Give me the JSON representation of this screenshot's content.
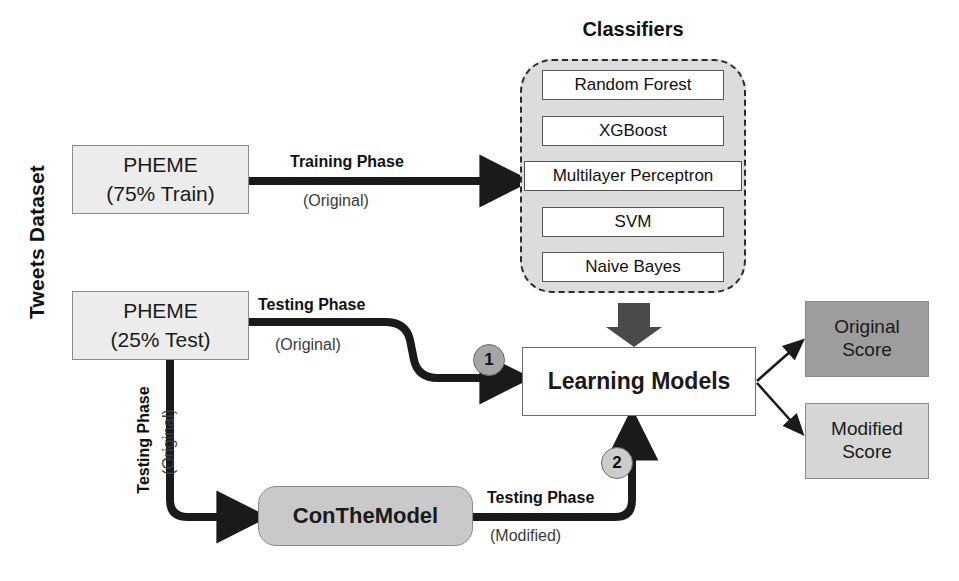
{
  "diagram": {
    "dataset_label": "Tweets Dataset",
    "classifiers": {
      "title": "Classifiers",
      "items": [
        {
          "label": "Random Forest"
        },
        {
          "label": "XGBoost"
        },
        {
          "label": "Multilayer Perceptron"
        },
        {
          "label": "SVM"
        },
        {
          "label": "Naive Bayes"
        }
      ]
    },
    "nodes": {
      "pheme_train": {
        "line1": "PHEME",
        "line2": "(75% Train)"
      },
      "pheme_test": {
        "line1": "PHEME",
        "line2": "(25% Test)"
      },
      "learning_models": {
        "label": "Learning Models"
      },
      "conthemodel": {
        "label": "ConTheModel"
      },
      "original_score": {
        "line1": "Original",
        "line2": "Score"
      },
      "modified_score": {
        "line1": "Modified",
        "line2": "Score"
      }
    },
    "edge_labels": {
      "training_phase": "Training Phase",
      "training_original": "(Original)",
      "testing_phase_top": "Testing Phase",
      "testing_original_top": "(Original)",
      "testing_phase_down": "Testing Phase",
      "testing_original_down": "(Original)",
      "testing_phase_bottom": "Testing Phase",
      "testing_modified_bottom": "(Modified)"
    },
    "steps": {
      "step1": "1",
      "step2": "2"
    },
    "colors": {
      "pheme_fill": "#ececec",
      "classifier_group_fill": "#dcdcdc",
      "classifier_item_fill": "#ffffff",
      "conthemodel_fill": "#c9c9c9",
      "original_score_fill": "#9d9d9d",
      "modified_score_fill": "#d6d6d6",
      "arrow_black": "#1a1a1a",
      "arrow_gray": "#4a4a4a",
      "badge1_fill": "#a6a6a6",
      "badge2_fill": "#cccccc"
    }
  }
}
